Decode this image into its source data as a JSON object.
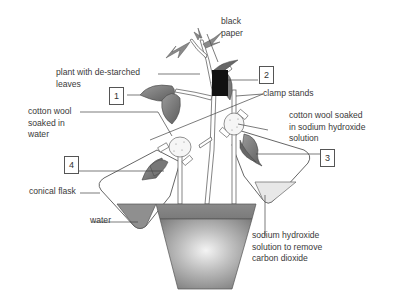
{
  "diagram": {
    "labels": {
      "black_paper": "black\npaper",
      "plant": "plant with de-starched\nleaves",
      "clamp_stands": "clamp stands",
      "cotton_water": "cotton wool\nsoaked in\nwater",
      "cotton_naoh": "cotton wool soaked\nin sodium hydroxide\nsolution",
      "conical_flask": "conical flask",
      "water": "water",
      "naoh_solution": "sodium hydroxide\nsolution to remove\ncarbon dioxide"
    },
    "numbered_boxes": [
      {
        "id": "1",
        "points_to": "leaf exposed to light"
      },
      {
        "id": "2",
        "points_to": "leaf covered with black paper"
      },
      {
        "id": "3",
        "points_to": "leaf in flask with sodium hydroxide"
      },
      {
        "id": "4",
        "points_to": "leaf in flask with water"
      }
    ],
    "colors": {
      "leaf": "#8a8a8a",
      "leaf_dark": "#5a5a5a",
      "black_paper": "#111111",
      "pot": "#8c8c8c",
      "pot_highlight": "#f2f2f2",
      "water": "#8f8f8f",
      "naoh": "#e6e6e6",
      "line": "#444444"
    }
  }
}
